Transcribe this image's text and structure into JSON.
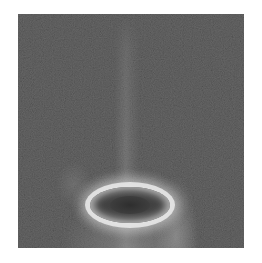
{
  "image": {
    "description": "Grayscale scientific photograph: dark noisy field with a faint vertical bright streak descending from the top center into a bright elliptical ring near the bottom center, with diffuse glow below the ring",
    "colors": {
      "background": "#393939",
      "ring_highlight": "#ebebeb",
      "ring_core": "#3c3c3c",
      "page_background": "#ffffff"
    }
  }
}
